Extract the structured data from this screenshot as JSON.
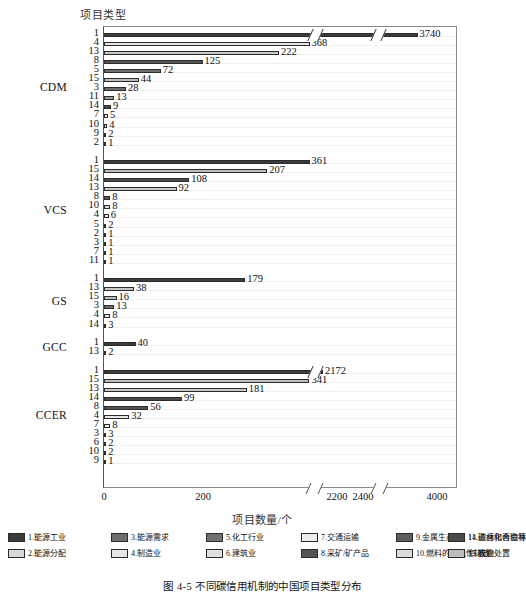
{
  "figure": {
    "caption": "图 4-5  不同碳信用机制的中国项目类型分布",
    "y_axis_title": "项目类型",
    "x_axis_title": "项目数量/个"
  },
  "axis": {
    "x_ticks": [
      "0",
      "200",
      "2200",
      "2400",
      "4000"
    ],
    "x_tick_positions_px": [
      104,
      203,
      337,
      363,
      437
    ],
    "breaks": [
      "break-1",
      "break-2"
    ],
    "grid": true
  },
  "groups": [
    {
      "name": "CDM"
    },
    {
      "name": "VCS"
    },
    {
      "name": "GS"
    },
    {
      "name": "GCC"
    },
    {
      "name": "CCER"
    }
  ],
  "legend": {
    "items": [
      {
        "id": "1",
        "label": "1.能源工业",
        "color": "#3b3b3b"
      },
      {
        "id": "2",
        "label": "2.能源分配",
        "color": "#d9d9d9"
      },
      {
        "id": "3",
        "label": "3.能源需求",
        "color": "#6e6e6e"
      },
      {
        "id": "4",
        "label": "4.制造业",
        "color": "#e6e6e6"
      },
      {
        "id": "5",
        "label": "5.化工行业",
        "color": "#707070"
      },
      {
        "id": "6",
        "label": "6.建筑业",
        "color": "#e0e0e0"
      },
      {
        "id": "7",
        "label": "7.交通运输",
        "color": "#ededed"
      },
      {
        "id": "8",
        "label": "8.采矿/矿产品",
        "color": "#555555"
      },
      {
        "id": "9",
        "label": "9.金属生产",
        "color": "#5e5e5e"
      },
      {
        "id": "10",
        "label": "10.燃料的飞逸性排放",
        "color": "#dcdcdc"
      },
      {
        "id": "11",
        "label": "11.碳卤化合物等",
        "color": "#9a9a9a"
      },
      {
        "id": "13",
        "label": "13.废物处置",
        "color": "#c9c9c9"
      },
      {
        "id": "14",
        "label": "14.造林和再造林",
        "color": "#4a4a4a"
      },
      {
        "id": "15",
        "label": "15.农业",
        "color": "#bdbdbd"
      }
    ]
  },
  "chart_data": {
    "type": "bar",
    "orientation": "horizontal",
    "title": "",
    "xlabel": "项目数量/个",
    "ylabel": "项目类型",
    "xlim": [
      0,
      4000
    ],
    "axis_breaks": [
      [
        260,
        2150
      ],
      [
        2450,
        3500
      ]
    ],
    "grid": true,
    "series": [
      {
        "name": "CDM",
        "categories": [
          "1",
          "4",
          "13",
          "8",
          "5",
          "15",
          "3",
          "11",
          "14",
          "7",
          "10",
          "9",
          "2"
        ],
        "values": [
          3740,
          368,
          222,
          125,
          72,
          44,
          28,
          13,
          9,
          5,
          4,
          2,
          1
        ]
      },
      {
        "name": "VCS",
        "categories": [
          "1",
          "15",
          "14",
          "13",
          "8",
          "10",
          "4",
          "5",
          "2",
          "3",
          "7",
          "11"
        ],
        "values": [
          361,
          207,
          108,
          92,
          8,
          8,
          6,
          2,
          1,
          1,
          1,
          1
        ]
      },
      {
        "name": "GS",
        "categories": [
          "1",
          "13",
          "15",
          "3",
          "4",
          "14"
        ],
        "values": [
          179,
          38,
          16,
          13,
          8,
          3
        ]
      },
      {
        "name": "GCC",
        "categories": [
          "1",
          "13"
        ],
        "values": [
          40,
          2
        ]
      },
      {
        "name": "CCER",
        "categories": [
          "1",
          "15",
          "13",
          "14",
          "8",
          "4",
          "7",
          "3",
          "6",
          "10",
          "9"
        ],
        "values": [
          2172,
          341,
          181,
          99,
          56,
          32,
          8,
          3,
          2,
          2,
          1
        ]
      }
    ]
  }
}
